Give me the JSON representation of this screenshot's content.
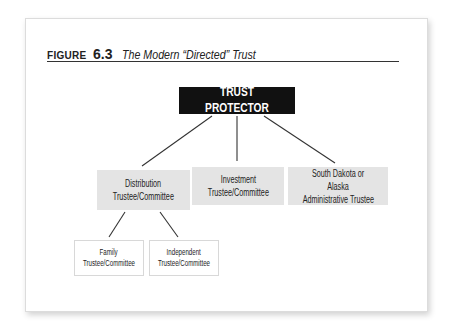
{
  "figure": {
    "label": "FIGURE",
    "number": "6.3",
    "title": "The Modern “Directed” Trust"
  },
  "nodes": {
    "protector": "TRUST PROTECTOR",
    "distribution": [
      "Distribution",
      "Trustee/Committee"
    ],
    "investment": [
      "Investment",
      "Trustee/Committee"
    ],
    "administrative": [
      "South Dakota or Alaska",
      "Administrative Trustee"
    ],
    "family": [
      "Family",
      "Trustee/Committee"
    ],
    "independent": [
      "Independent",
      "Trustee/Committee"
    ]
  },
  "colors": {
    "protector_bg": "#111111",
    "level2_bg": "#e4e4e4",
    "line": "#333333"
  }
}
